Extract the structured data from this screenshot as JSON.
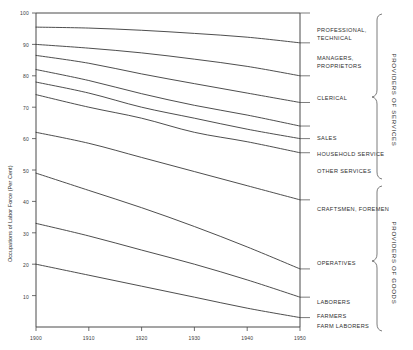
{
  "chart_data": {
    "type": "area",
    "title": "",
    "subtitle": "",
    "xlabel": "",
    "ylabel": "Occupations of Labor Force (Per Cent)",
    "x": [
      1900,
      1910,
      1920,
      1930,
      1940,
      1950
    ],
    "xtick_labels": [
      "1900",
      "1910",
      "1920",
      "1930",
      "1940",
      "1950"
    ],
    "xlim": [
      1900,
      1950
    ],
    "ylim": [
      0,
      100
    ],
    "ytick_labels": [
      "10",
      "20",
      "30",
      "40",
      "50",
      "60",
      "70",
      "80",
      "90",
      "100"
    ],
    "yticks": [
      10,
      20,
      30,
      40,
      50,
      60,
      70,
      80,
      90,
      100
    ],
    "grid": false,
    "legend_position": "right",
    "note": "Stacked cumulative boundaries; each series value is the cumulative per-cent at that boundary line, read top-down from 100.",
    "series": [
      {
        "name": "PROFESSIONAL, TECHNICAL",
        "values": [
          100,
          100,
          100,
          100,
          100,
          100
        ]
      },
      {
        "name": "MANAGERS, PROPRIETORS",
        "values": [
          95.5,
          95.2,
          94.5,
          93.5,
          92.3,
          90.5
        ]
      },
      {
        "name": "CLERICAL",
        "values": [
          90.0,
          88.8,
          87.3,
          85.3,
          83.0,
          80.0
        ]
      },
      {
        "name": "SALES",
        "values": [
          86.5,
          84.0,
          80.6,
          77.5,
          74.5,
          71.5
        ]
      },
      {
        "name": "HOUSEHOLD SERVICE",
        "values": [
          82.0,
          78.5,
          74.3,
          70.6,
          67.5,
          64.0
        ]
      },
      {
        "name": "OTHER SERVICES",
        "values": [
          78.0,
          74.5,
          70.0,
          66.5,
          63.0,
          60.0
        ]
      },
      {
        "name": "CRAFTSMEN, FOREMEN",
        "values": [
          74.0,
          70.0,
          66.5,
          62.0,
          59.0,
          55.5
        ]
      },
      {
        "name": "OPERATIVES",
        "values": [
          62.0,
          58.5,
          54.0,
          49.5,
          45.0,
          40.5
        ]
      },
      {
        "name": "LABORERS",
        "values": [
          49.0,
          43.5,
          38.0,
          32.0,
          25.5,
          18.5
        ]
      },
      {
        "name": "FARMERS",
        "values": [
          33.0,
          29.0,
          24.5,
          20.0,
          15.0,
          9.5
        ]
      },
      {
        "name": "FARM LABORERS",
        "values": [
          20.0,
          16.5,
          13.0,
          9.5,
          6.0,
          3.0
        ]
      }
    ]
  },
  "axes": {
    "y_title": "Occupations of Labor Force (Per Cent)",
    "y_ticks": [
      "100",
      "90",
      "80",
      "70",
      "60",
      "50",
      "40",
      "30",
      "20",
      "10"
    ],
    "x_ticks": [
      "1900",
      "1910",
      "1920",
      "1930",
      "1940",
      "1950"
    ]
  },
  "category_labels": [
    {
      "id": "professional-technical",
      "line1": "PROFESSIONAL,",
      "line2": "TECHNICAL"
    },
    {
      "id": "managers-proprietors",
      "line1": "MANAGERS,",
      "line2": "PROPRIETORS"
    },
    {
      "id": "clerical",
      "line1": "CLERICAL",
      "line2": ""
    },
    {
      "id": "sales",
      "line1": "SALES",
      "line2": ""
    },
    {
      "id": "household-service",
      "line1": "HOUSEHOLD SERVICE",
      "line2": ""
    },
    {
      "id": "other-services",
      "line1": "OTHER SERVICES",
      "line2": ""
    },
    {
      "id": "craftsmen-foremen",
      "line1": "CRAFTSMEN, FOREMEN",
      "line2": ""
    },
    {
      "id": "operatives",
      "line1": "OPERATIVES",
      "line2": ""
    },
    {
      "id": "laborers",
      "line1": "LABORERS",
      "line2": ""
    },
    {
      "id": "farmers",
      "line1": "FARMERS",
      "line2": ""
    },
    {
      "id": "farm-laborers",
      "line1": "FARM LABORERS",
      "line2": ""
    }
  ],
  "groups": [
    {
      "id": "providers-of-services",
      "label": "PROVIDERS OF SERVICES"
    },
    {
      "id": "providers-of-goods",
      "label": "PROVIDERS OF GOODS"
    }
  ],
  "colors": {
    "line": "#3a3a3a",
    "axis": "#4a4a4a",
    "text": "#2e2e2e",
    "background": "#ffffff"
  }
}
